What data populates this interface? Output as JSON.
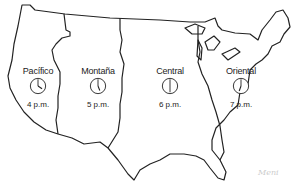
{
  "map": {
    "subject": "Time zones of the United States",
    "zones": [
      {
        "name": "Pacífico",
        "time": "4 p.m.",
        "hour": 4
      },
      {
        "name": "Montaña",
        "time": "5 p.m.",
        "hour": 5
      },
      {
        "name": "Central",
        "time": "6 p.m.",
        "hour": 6
      },
      {
        "name": "Oriental",
        "time": "7 p.m.",
        "hour": 7
      }
    ],
    "signature": "Meni",
    "colors": {
      "line": "#222222",
      "background": "#ffffff"
    }
  }
}
